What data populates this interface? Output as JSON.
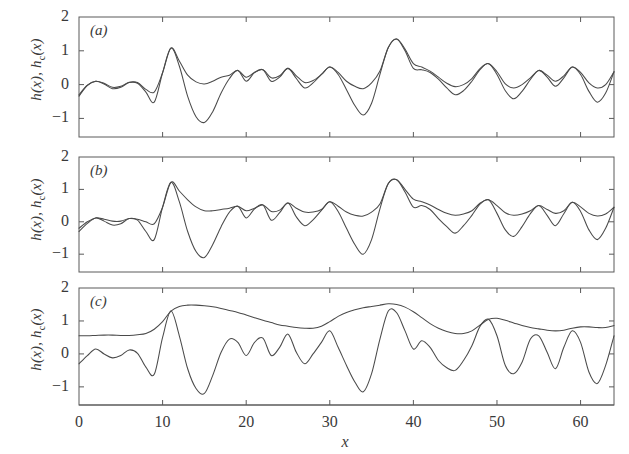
{
  "figure": {
    "xlabel": "x",
    "ylabel_main": "h(x), h",
    "ylabel_sub": "c",
    "ylabel_tail": "(x)",
    "panels": [
      {
        "tag": "(a)"
      },
      {
        "tag": "(b)"
      },
      {
        "tag": "(c)"
      }
    ],
    "yticks": [
      "2",
      "1",
      "0",
      "-1"
    ],
    "ytick_values": [
      2,
      1,
      0,
      -1
    ],
    "xticks": [
      "0",
      "10",
      "20",
      "30",
      "40",
      "50",
      "60"
    ],
    "xtick_values": [
      0,
      10,
      20,
      30,
      40,
      50,
      60
    ],
    "line_color": "#4a4a4a",
    "frame_color": "#5a5a5a",
    "background": "#ffffff"
  },
  "chart_data": {
    "type": "line",
    "title": "",
    "subtitle": "",
    "xlabel": "x",
    "ylabel": "h(x), h_c(x)",
    "xlim": [
      0,
      64
    ],
    "ylim": [
      -1.55,
      2.0
    ],
    "grid": false,
    "legend": "none",
    "n_panels": 3,
    "panel_labels": [
      "(a)",
      "(b)",
      "(c)"
    ],
    "series_names": [
      "h(x)",
      "h_c(x)"
    ],
    "x_step": 0.25,
    "panels": [
      {
        "label": "(a)",
        "description": "h(x) rough surface and its coarse-grained counterpart h_c(x) at the smallest coarse-graining scale; h_c follows h closely except it cuts across the deepest troughs.",
        "series": [
          {
            "name": "h(x)",
            "x": [
              0,
              1,
              2,
              3,
              4,
              5,
              6,
              7,
              8,
              9,
              10,
              11,
              12,
              13,
              14,
              15,
              16,
              17,
              18,
              19,
              20,
              21,
              22,
              23,
              24,
              25,
              26,
              27,
              28,
              29,
              30,
              31,
              32,
              33,
              34,
              35,
              36,
              37,
              38,
              39,
              40,
              41,
              42,
              43,
              44,
              45,
              46,
              47,
              48,
              49,
              50,
              51,
              52,
              53,
              54,
              55,
              56,
              57,
              58,
              59,
              60,
              61,
              62,
              63,
              64
            ],
            "values": [
              -0.34,
              -0.02,
              0.1,
              0.02,
              -0.12,
              -0.08,
              0.06,
              0.04,
              -0.22,
              -0.52,
              0.35,
              1.08,
              0.55,
              -0.35,
              -0.95,
              -1.12,
              -0.8,
              -0.25,
              0.18,
              0.42,
              0.1,
              0.36,
              0.44,
              0.1,
              0.22,
              0.48,
              0.18,
              -0.1,
              0.05,
              0.3,
              0.52,
              0.3,
              -0.15,
              -0.62,
              -0.9,
              -0.55,
              0.3,
              1.1,
              1.35,
              1.0,
              0.48,
              0.44,
              0.36,
              0.16,
              -0.1,
              -0.3,
              -0.18,
              0.1,
              0.45,
              0.62,
              0.3,
              -0.18,
              -0.42,
              -0.2,
              0.15,
              0.42,
              0.22,
              -0.05,
              0.2,
              0.52,
              0.3,
              -0.2,
              -0.52,
              -0.25,
              0.38
            ]
          },
          {
            "name": "h_c(x)",
            "x": [
              0,
              1,
              2,
              3,
              4,
              5,
              6,
              7,
              8,
              9,
              10,
              11,
              12,
              13,
              14,
              15,
              16,
              17,
              18,
              19,
              20,
              21,
              22,
              23,
              24,
              25,
              26,
              27,
              28,
              29,
              30,
              31,
              32,
              33,
              34,
              35,
              36,
              37,
              38,
              39,
              40,
              41,
              42,
              43,
              44,
              45,
              46,
              47,
              48,
              49,
              50,
              51,
              52,
              53,
              54,
              55,
              56,
              57,
              58,
              59,
              60,
              61,
              62,
              63,
              64
            ],
            "values": [
              -0.3,
              -0.02,
              0.1,
              0.04,
              -0.08,
              -0.05,
              0.07,
              0.06,
              -0.14,
              -0.22,
              0.35,
              1.08,
              0.7,
              0.28,
              0.08,
              0.02,
              0.1,
              0.22,
              0.28,
              0.42,
              0.22,
              0.36,
              0.44,
              0.2,
              0.26,
              0.48,
              0.26,
              0.06,
              0.12,
              0.3,
              0.52,
              0.36,
              0.1,
              -0.05,
              -0.12,
              0.05,
              0.4,
              1.1,
              1.35,
              1.05,
              0.62,
              0.52,
              0.4,
              0.22,
              0.04,
              -0.06,
              0.0,
              0.18,
              0.48,
              0.62,
              0.38,
              0.02,
              -0.1,
              0.0,
              0.2,
              0.42,
              0.28,
              0.1,
              0.26,
              0.52,
              0.36,
              0.05,
              -0.1,
              0.0,
              0.38
            ]
          }
        ]
      },
      {
        "label": "(b)",
        "description": "Intermediate coarse-graining scale; h_c(x) is visibly smoother, bridging over several small oscillations of h(x).",
        "series": [
          {
            "name": "h(x)",
            "x": [
              0,
              1,
              2,
              3,
              4,
              5,
              6,
              7,
              8,
              9,
              10,
              11,
              12,
              13,
              14,
              15,
              16,
              17,
              18,
              19,
              20,
              21,
              22,
              23,
              24,
              25,
              26,
              27,
              28,
              29,
              30,
              31,
              32,
              33,
              34,
              35,
              36,
              37,
              38,
              39,
              40,
              41,
              42,
              43,
              44,
              45,
              46,
              47,
              48,
              49,
              50,
              51,
              52,
              53,
              54,
              55,
              56,
              57,
              58,
              59,
              60,
              61,
              62,
              63,
              64
            ],
            "values": [
              -0.3,
              -0.05,
              0.12,
              0.02,
              -0.1,
              -0.06,
              0.1,
              0.05,
              -0.3,
              -0.55,
              0.45,
              1.22,
              0.62,
              -0.3,
              -0.92,
              -1.1,
              -0.7,
              -0.15,
              0.3,
              0.48,
              0.12,
              0.4,
              0.52,
              0.05,
              0.28,
              0.58,
              0.15,
              -0.12,
              0.06,
              0.35,
              0.62,
              0.32,
              -0.2,
              -0.7,
              -1.0,
              -0.55,
              0.4,
              1.18,
              1.3,
              0.92,
              0.45,
              0.5,
              0.38,
              0.1,
              -0.15,
              -0.35,
              -0.12,
              0.2,
              0.55,
              0.68,
              0.26,
              -0.25,
              -0.45,
              -0.15,
              0.25,
              0.5,
              0.2,
              -0.12,
              0.25,
              0.6,
              0.32,
              -0.25,
              -0.55,
              -0.2,
              0.45
            ]
          },
          {
            "name": "h_c(x)",
            "x": [
              0,
              1,
              2,
              3,
              4,
              5,
              6,
              7,
              8,
              9,
              10,
              11,
              12,
              13,
              14,
              15,
              16,
              17,
              18,
              19,
              20,
              21,
              22,
              23,
              24,
              25,
              26,
              27,
              28,
              29,
              30,
              31,
              32,
              33,
              34,
              35,
              36,
              37,
              38,
              39,
              40,
              41,
              42,
              43,
              44,
              45,
              46,
              47,
              48,
              49,
              50,
              51,
              52,
              53,
              54,
              55,
              56,
              57,
              58,
              59,
              60,
              61,
              62,
              63,
              64
            ],
            "values": [
              -0.2,
              0.0,
              0.12,
              0.08,
              0.02,
              0.02,
              0.1,
              0.08,
              0.0,
              -0.06,
              0.45,
              1.22,
              0.95,
              0.68,
              0.46,
              0.34,
              0.34,
              0.38,
              0.42,
              0.48,
              0.34,
              0.42,
              0.52,
              0.32,
              0.36,
              0.58,
              0.42,
              0.3,
              0.3,
              0.38,
              0.62,
              0.48,
              0.3,
              0.2,
              0.18,
              0.3,
              0.55,
              1.18,
              1.3,
              1.0,
              0.7,
              0.62,
              0.52,
              0.38,
              0.26,
              0.2,
              0.24,
              0.34,
              0.58,
              0.68,
              0.5,
              0.28,
              0.2,
              0.24,
              0.34,
              0.5,
              0.38,
              0.26,
              0.34,
              0.6,
              0.46,
              0.26,
              0.18,
              0.24,
              0.45
            ]
          }
        ]
      },
      {
        "label": "(c)",
        "description": "Largest coarse-graining scale; h_c(x) is a smooth broad envelope lying well above h(x) and touching it only at the dominant peaks.",
        "series": [
          {
            "name": "h(x)",
            "x": [
              0,
              1,
              2,
              3,
              4,
              5,
              6,
              7,
              8,
              9,
              10,
              11,
              12,
              13,
              14,
              15,
              16,
              17,
              18,
              19,
              20,
              21,
              22,
              23,
              24,
              25,
              26,
              27,
              28,
              29,
              30,
              31,
              32,
              33,
              34,
              35,
              36,
              37,
              38,
              39,
              40,
              41,
              42,
              43,
              44,
              45,
              46,
              47,
              48,
              49,
              50,
              51,
              52,
              53,
              54,
              55,
              56,
              57,
              58,
              59,
              60,
              61,
              62,
              63,
              64
            ],
            "values": [
              -0.3,
              -0.05,
              0.15,
              0.0,
              -0.12,
              -0.05,
              0.12,
              0.02,
              -0.4,
              -0.62,
              0.5,
              1.3,
              0.55,
              -0.45,
              -1.05,
              -1.2,
              -0.65,
              0.05,
              0.45,
              0.35,
              -0.05,
              0.35,
              0.48,
              -0.05,
              0.2,
              0.6,
              0.05,
              -0.3,
              0.0,
              0.35,
              0.7,
              0.2,
              -0.35,
              -0.85,
              -1.15,
              -0.6,
              0.45,
              1.3,
              1.25,
              0.7,
              0.15,
              0.4,
              0.2,
              -0.2,
              -0.42,
              -0.5,
              -0.2,
              0.25,
              0.85,
              1.05,
              0.55,
              -0.35,
              -0.6,
              -0.25,
              0.45,
              0.55,
              0.05,
              -0.45,
              0.2,
              0.7,
              0.35,
              -0.55,
              -0.9,
              -0.35,
              0.55
            ]
          },
          {
            "name": "h_c(x)",
            "x": [
              0,
              1,
              2,
              3,
              4,
              5,
              6,
              7,
              8,
              9,
              10,
              11,
              12,
              13,
              14,
              15,
              16,
              17,
              18,
              19,
              20,
              21,
              22,
              23,
              24,
              25,
              26,
              27,
              28,
              29,
              30,
              31,
              32,
              33,
              34,
              35,
              36,
              37,
              38,
              39,
              40,
              41,
              42,
              43,
              44,
              45,
              46,
              47,
              48,
              49,
              50,
              51,
              52,
              53,
              54,
              55,
              56,
              57,
              58,
              59,
              60,
              61,
              62,
              63,
              64
            ],
            "values": [
              0.55,
              0.55,
              0.56,
              0.57,
              0.57,
              0.56,
              0.56,
              0.58,
              0.62,
              0.75,
              0.98,
              1.3,
              1.44,
              1.48,
              1.48,
              1.46,
              1.43,
              1.38,
              1.32,
              1.26,
              1.18,
              1.1,
              1.02,
              0.95,
              0.88,
              0.84,
              0.8,
              0.78,
              0.78,
              0.84,
              0.98,
              1.14,
              1.26,
              1.34,
              1.4,
              1.44,
              1.48,
              1.52,
              1.5,
              1.42,
              1.28,
              1.1,
              0.92,
              0.78,
              0.68,
              0.62,
              0.62,
              0.7,
              0.88,
              1.05,
              1.08,
              1.02,
              0.94,
              0.86,
              0.8,
              0.76,
              0.72,
              0.7,
              0.72,
              0.78,
              0.82,
              0.82,
              0.8,
              0.8,
              0.86
            ]
          }
        ]
      }
    ]
  }
}
